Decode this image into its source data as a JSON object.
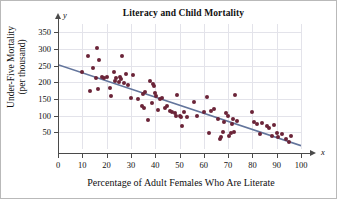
{
  "chart_data": {
    "type": "scatter",
    "title": "Literacy and Child Mortality",
    "xlabel": "Percentage of Adult Females Who Are Literate",
    "ylabel": "Under-Five Mortality (per thousand)",
    "ylabel_line1": "Under-Five Mortality",
    "ylabel_line2": "(per thousand)",
    "axis_letter_x": "x",
    "axis_letter_y": "y",
    "xlim": [
      0,
      100
    ],
    "ylim": [
      0,
      375
    ],
    "xticks": [
      0,
      10,
      20,
      30,
      40,
      50,
      60,
      70,
      80,
      90,
      100
    ],
    "yticks": [
      50,
      100,
      150,
      200,
      250,
      300,
      350
    ],
    "grid": true,
    "legend": "none",
    "point_color": "#6b2438",
    "trendline_color": "#63759c",
    "trendline": {
      "label": "least-squares regression line",
      "x": [
        0,
        100
      ],
      "y": [
        253,
        10
      ]
    },
    "points": [
      [
        10,
        230
      ],
      [
        12.5,
        280
      ],
      [
        13,
        175
      ],
      [
        14.5,
        242
      ],
      [
        15.5,
        213
      ],
      [
        16,
        302
      ],
      [
        16.5,
        180
      ],
      [
        17,
        268
      ],
      [
        18,
        215
      ],
      [
        19,
        212
      ],
      [
        20,
        215
      ],
      [
        21.5,
        183
      ],
      [
        22,
        160
      ],
      [
        23,
        230
      ],
      [
        23.5,
        205
      ],
      [
        24,
        213
      ],
      [
        25,
        200
      ],
      [
        25.5,
        216
      ],
      [
        26,
        210
      ],
      [
        26.5,
        278
      ],
      [
        27,
        198
      ],
      [
        28,
        225
      ],
      [
        29,
        193
      ],
      [
        30,
        152
      ],
      [
        31,
        222
      ],
      [
        33,
        150
      ],
      [
        34.5,
        130
      ],
      [
        35,
        165
      ],
      [
        35.5,
        122
      ],
      [
        36,
        170
      ],
      [
        37,
        88
      ],
      [
        38,
        205
      ],
      [
        38.5,
        138
      ],
      [
        39,
        196
      ],
      [
        39.5,
        190
      ],
      [
        40,
        168
      ],
      [
        40.5,
        160
      ],
      [
        41,
        118
      ],
      [
        42,
        150
      ],
      [
        43,
        152
      ],
      [
        44,
        122
      ],
      [
        45,
        130
      ],
      [
        46,
        113
      ],
      [
        47,
        110
      ],
      [
        48,
        108
      ],
      [
        48.5,
        100
      ],
      [
        49,
        162
      ],
      [
        50,
        100
      ],
      [
        50.5,
        95
      ],
      [
        51,
        68
      ],
      [
        52,
        112
      ],
      [
        53,
        97
      ],
      [
        56,
        140
      ],
      [
        57,
        98
      ],
      [
        60,
        110
      ],
      [
        61.5,
        157
      ],
      [
        62,
        48
      ],
      [
        63,
        115
      ],
      [
        64,
        120
      ],
      [
        66,
        90
      ],
      [
        66.5,
        30
      ],
      [
        67,
        35
      ],
      [
        68,
        52
      ],
      [
        68.5,
        82
      ],
      [
        69,
        108
      ],
      [
        70,
        100
      ],
      [
        70.5,
        40
      ],
      [
        71,
        48
      ],
      [
        71.5,
        75
      ],
      [
        72,
        90
      ],
      [
        72.5,
        50
      ],
      [
        73,
        162
      ],
      [
        73.5,
        85
      ],
      [
        80,
        112
      ],
      [
        80.5,
        82
      ],
      [
        82,
        75
      ],
      [
        83,
        45
      ],
      [
        84,
        78
      ],
      [
        86,
        70
      ],
      [
        87,
        62
      ],
      [
        88,
        40
      ],
      [
        89,
        72
      ],
      [
        90,
        48
      ],
      [
        90.5,
        35
      ],
      [
        92,
        45
      ],
      [
        94,
        30
      ],
      [
        95,
        22
      ],
      [
        96,
        38
      ]
    ]
  }
}
